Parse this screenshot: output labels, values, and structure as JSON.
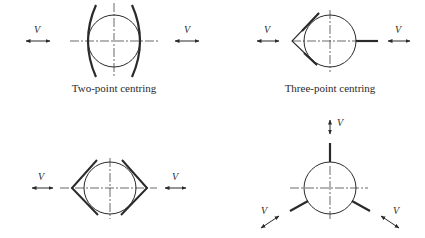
{
  "diagram": {
    "stroke_color": "#2a2a2a",
    "panels": [
      {
        "id": "two-point",
        "caption": "Two-point centring",
        "velocity_labels": [
          "V",
          "V"
        ]
      },
      {
        "id": "three-point",
        "caption": "Three-point centring",
        "velocity_labels": [
          "V",
          "V"
        ]
      },
      {
        "id": "four-point-v-jaws",
        "caption": "",
        "velocity_labels": [
          "V",
          "V"
        ]
      },
      {
        "id": "three-radial-jaws",
        "caption": "",
        "velocity_labels": [
          "V",
          "V",
          "V"
        ]
      }
    ]
  }
}
